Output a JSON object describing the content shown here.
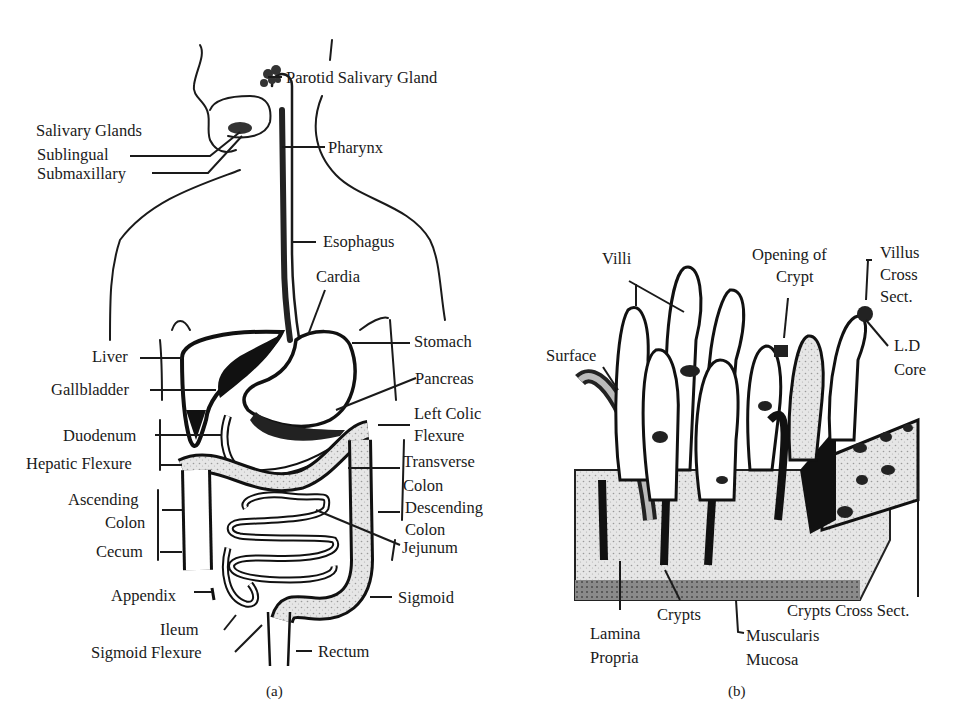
{
  "figure_a": {
    "caption": "(a)",
    "labels": {
      "parotid": "Parotid Salivary Gland",
      "salivary_glands": "Salivary Glands",
      "sublingual": "Sublingual",
      "submaxillary": "Submaxillary",
      "pharynx": "Pharynx",
      "esophagus": "Esophagus",
      "cardia": "Cardia",
      "liver": "Liver",
      "stomach": "Stomach",
      "gallbladder": "Gallbladder",
      "pancreas": "Pancreas",
      "left_colic_1": "Left Colic",
      "left_colic_2": "Flexure",
      "duodenum": "Duodenum",
      "hepatic_flexure": "Hepatic Flexure",
      "transverse_1": "Transverse",
      "transverse_2": "Colon",
      "ascending_1": "Ascending",
      "ascending_2": "Colon",
      "descending_1": "Descending",
      "descending_2": "Colon",
      "cecum": "Cecum",
      "jejunum": "Jejunum",
      "appendix": "Appendix",
      "sigmoid": "Sigmoid",
      "ileum": "Ileum",
      "sigmoid_flexure": "Sigmoid Flexure",
      "rectum": "Rectum"
    }
  },
  "figure_b": {
    "caption": "(b)",
    "labels": {
      "villi": "Villi",
      "opening_1": "Opening of",
      "opening_2": "Crypt",
      "villus_1": "Villus",
      "villus_2": "Cross",
      "villus_3": "Sect.",
      "ld_1": "L.D",
      "ld_2": "Core",
      "surface": "Surface",
      "crypts": "Crypts",
      "crypts_cross": "Crypts Cross Sect.",
      "lamina_1": "Lamina",
      "lamina_2": "Propria",
      "musc_1": "Muscularis",
      "musc_2": "Mucosa"
    }
  }
}
